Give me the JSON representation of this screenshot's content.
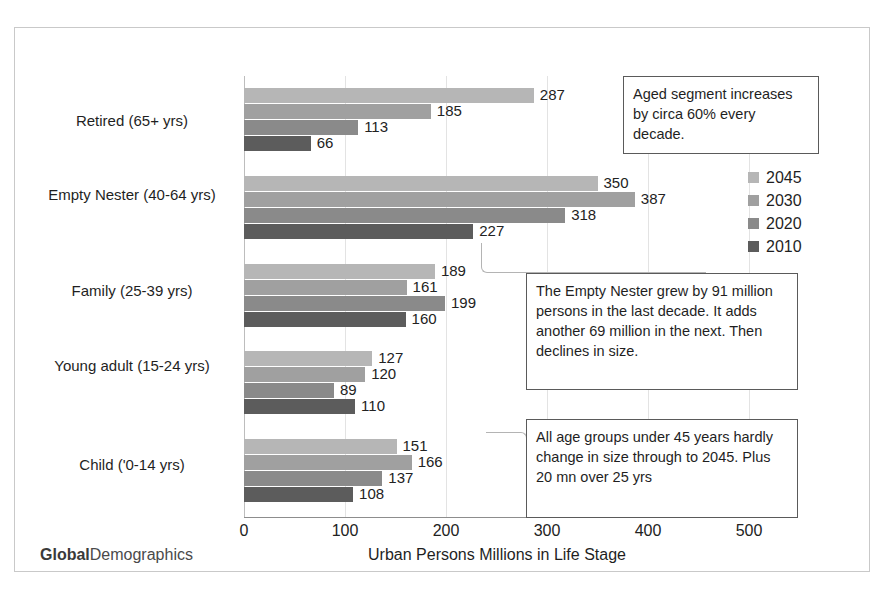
{
  "chart_data": {
    "type": "bar",
    "orientation": "horizontal",
    "title": "",
    "xlabel": "Urban Persons Millions in Life Stage",
    "ylabel": "",
    "xlim": [
      0,
      500
    ],
    "xticks": [
      "0",
      "100",
      "200",
      "300",
      "400",
      "500"
    ],
    "grid": true,
    "legend_position": "right",
    "categories": [
      "Retired (65+ yrs)",
      "Empty Nester (40-64 yrs)",
      "Family (25-39 yrs)",
      "Young adult (15-24 yrs)",
      "Child ('0-14 yrs)"
    ],
    "series": [
      {
        "name": "2045",
        "color": "#b6b6b6",
        "values": [
          287,
          350,
          189,
          127,
          151
        ]
      },
      {
        "name": "2030",
        "color": "#a0a0a0",
        "values": [
          185,
          387,
          161,
          120,
          166
        ]
      },
      {
        "name": "2020",
        "color": "#8a8a8a",
        "values": [
          113,
          318,
          199,
          89,
          137
        ]
      },
      {
        "name": "2010",
        "color": "#5c5c5c",
        "values": [
          66,
          227,
          160,
          110,
          108
        ]
      }
    ],
    "annotations": [
      "Aged segment increases by  circa 60% every decade.",
      "The Empty Nester grew by 91 million persons in the last decade. It adds another 69 million in the next. Then declines in size.",
      "All age groups under 45 years hardly change in size through to 2045. Plus 20 mn over 25 yrs"
    ]
  },
  "legend": {
    "items": [
      {
        "label": "2045",
        "color": "#b6b6b6"
      },
      {
        "label": "2030",
        "color": "#a0a0a0"
      },
      {
        "label": "2020",
        "color": "#8a8a8a"
      },
      {
        "label": "2010",
        "color": "#5c5c5c"
      }
    ]
  },
  "callouts": {
    "aged": "Aged segment increases by  circa 60% every decade.",
    "empty_nester": "The Empty Nester grew by 91 million persons in the last decade. It adds another 69 million in the next. Then declines in size.",
    "under45": "All age groups under 45 years hardly change in size through to 2045. Plus 20 mn over 25 yrs"
  },
  "axis": {
    "x_title": "Urban Persons Millions in Life Stage",
    "x_ticks": [
      "0",
      "100",
      "200",
      "300",
      "400",
      "500"
    ]
  },
  "categories": [
    "Retired (65+ yrs)",
    "Empty Nester (40-64 yrs)",
    "Family (25-39 yrs)",
    "Young adult (15-24 yrs)",
    "Child ('0-14 yrs)"
  ],
  "branding": {
    "logo_bold": "Global",
    "logo_rest": "Demographics"
  }
}
